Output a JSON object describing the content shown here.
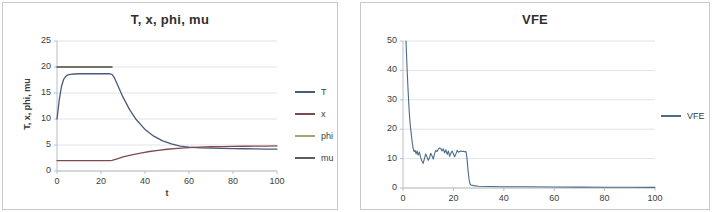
{
  "chart_data": [
    {
      "type": "line",
      "title": "T, x, phi, mu",
      "xlabel": "t",
      "ylabel": "T, x, phi, mu",
      "xlim": [
        0,
        100
      ],
      "ylim": [
        0,
        25
      ],
      "xticks": [
        0,
        20,
        40,
        60,
        80,
        100
      ],
      "yticks": [
        0,
        5,
        10,
        15,
        20,
        25
      ],
      "grid": true,
      "legend_position": "right",
      "colors": {
        "T": "#4a5a78",
        "x": "#7d4a4f",
        "phi": "#a8a472",
        "mu": "#5c5c5c"
      },
      "series": [
        {
          "name": "T",
          "color": "#4a5a78",
          "x": [
            0,
            1,
            2,
            3,
            4,
            5,
            6,
            8,
            10,
            14,
            18,
            22,
            24,
            25,
            26,
            28,
            30,
            33,
            36,
            40,
            44,
            48,
            52,
            56,
            60,
            65,
            70,
            75,
            80,
            85,
            90,
            95,
            100
          ],
          "y": [
            10.0,
            13.6,
            16.2,
            17.6,
            18.2,
            18.5,
            18.6,
            18.65,
            18.7,
            18.7,
            18.7,
            18.7,
            18.7,
            18.6,
            18.0,
            16.1,
            14.2,
            11.8,
            9.9,
            8.0,
            6.7,
            5.8,
            5.2,
            4.8,
            4.6,
            4.45,
            4.4,
            4.35,
            4.3,
            4.28,
            4.25,
            4.22,
            4.2
          ]
        },
        {
          "name": "x",
          "color": "#7d4a4f",
          "x": [
            0,
            5,
            10,
            15,
            20,
            24,
            25,
            27,
            30,
            34,
            38,
            42,
            46,
            50,
            55,
            60,
            65,
            70,
            75,
            80,
            85,
            90,
            95,
            100
          ],
          "y": [
            2.0,
            2.0,
            2.0,
            2.0,
            2.0,
            2.0,
            2.05,
            2.3,
            2.7,
            3.1,
            3.45,
            3.75,
            3.98,
            4.18,
            4.36,
            4.5,
            4.6,
            4.66,
            4.7,
            4.73,
            4.76,
            4.78,
            4.8,
            4.82
          ]
        },
        {
          "name": "phi",
          "color": "#a8a472",
          "x": [
            0,
            4,
            8,
            12,
            16,
            20,
            24,
            25
          ],
          "y": [
            20.0,
            20.0,
            20.0,
            20.0,
            20.0,
            20.0,
            20.0,
            20.0
          ]
        },
        {
          "name": "mu",
          "color": "#5c5c5c",
          "x": [
            0,
            4,
            8,
            12,
            16,
            20,
            24,
            25
          ],
          "y": [
            20.0,
            20.0,
            20.0,
            20.0,
            20.0,
            20.0,
            20.0,
            20.0
          ]
        }
      ]
    },
    {
      "type": "line",
      "title": "VFE",
      "xlabel": "",
      "ylabel": "",
      "xlim": [
        0,
        100
      ],
      "ylim": [
        0,
        50
      ],
      "xticks": [
        0,
        20,
        40,
        60,
        80,
        100
      ],
      "yticks": [
        0,
        10,
        20,
        30,
        40,
        50
      ],
      "grid": true,
      "legend_position": "right",
      "colors": {
        "VFE": "#4a6b8a"
      },
      "series": [
        {
          "name": "VFE",
          "color": "#4a6b8a",
          "x": [
            1.2,
            1.6,
            2.0,
            2.4,
            2.8,
            3.2,
            3.6,
            4.0,
            4.4,
            4.8,
            5.2,
            5.6,
            6.0,
            6.5,
            7.0,
            7.5,
            8.0,
            8.5,
            9.0,
            9.5,
            10.0,
            10.5,
            11.0,
            11.5,
            12.0,
            12.5,
            13.0,
            13.5,
            14.0,
            14.5,
            15.0,
            15.5,
            16.0,
            16.5,
            17.0,
            17.5,
            18.0,
            18.5,
            19.0,
            19.5,
            20.0,
            20.5,
            21.0,
            21.5,
            22.0,
            22.5,
            23.0,
            23.5,
            24.0,
            24.5,
            25.0,
            25.4,
            25.8,
            26.2,
            26.6,
            27.0,
            28.0,
            30.0,
            34.0,
            40.0,
            50.0,
            60.0,
            70.0,
            80.0,
            90.0,
            100.0
          ],
          "y": [
            50.0,
            41.0,
            33.5,
            27.0,
            22.0,
            19.0,
            16.0,
            13.6,
            12.4,
            12.8,
            11.6,
            12.6,
            11.2,
            12.2,
            10.4,
            9.2,
            8.4,
            10.0,
            11.6,
            10.6,
            9.4,
            10.2,
            11.8,
            11.0,
            9.8,
            11.6,
            12.8,
            12.4,
            13.2,
            13.6,
            13.4,
            12.6,
            13.3,
            12.0,
            13.0,
            11.4,
            12.6,
            10.8,
            11.8,
            12.6,
            11.6,
            10.6,
            11.6,
            12.8,
            12.2,
            12.4,
            12.6,
            12.4,
            12.5,
            12.3,
            12.4,
            10.0,
            6.0,
            3.0,
            1.4,
            1.0,
            0.8,
            0.6,
            0.5,
            0.45,
            0.4,
            0.35,
            0.3,
            0.28,
            0.25,
            0.22
          ]
        }
      ]
    }
  ],
  "left_chart": {
    "title": "T, x, phi, mu",
    "xlabel": "t",
    "ylabel": "T, x, phi, mu",
    "yticks": [
      "25",
      "20",
      "15",
      "10",
      "5",
      "0"
    ],
    "xticks": [
      "0",
      "20",
      "40",
      "60",
      "80",
      "100"
    ],
    "legend": [
      {
        "label": "T",
        "color": "#4a5a78"
      },
      {
        "label": "x",
        "color": "#7d4a4f"
      },
      {
        "label": "phi",
        "color": "#a8a472"
      },
      {
        "label": "mu",
        "color": "#5c5c5c"
      }
    ]
  },
  "right_chart": {
    "title": "VFE",
    "xlabel": "",
    "ylabel": "",
    "yticks": [
      "50",
      "40",
      "30",
      "20",
      "10",
      "0"
    ],
    "xticks": [
      "0",
      "20",
      "40",
      "60",
      "80",
      "100"
    ],
    "legend": [
      {
        "label": "VFE",
        "color": "#4a6b8a"
      }
    ]
  }
}
